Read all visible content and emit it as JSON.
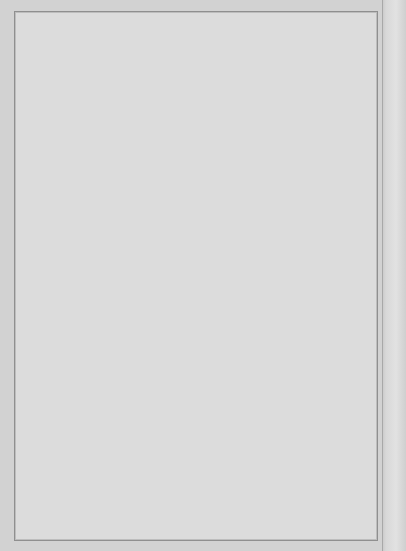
{
  "figure": {
    "panel_letter": "C",
    "background_color": "#dcdcdc",
    "plot_area_color": "#ffffff",
    "ink_color": "#111111"
  },
  "chart_data": [
    {
      "id": "panel-top",
      "type": "line",
      "title": "",
      "xlabel": "LV volume, mL",
      "ylabel": "LV diastolic pressure, mm Hg",
      "xlabel_plain": "LV volume,",
      "xlabel_italic": "mL",
      "ylabel_plain": "LV diastolic pressure,",
      "ylabel_italic": "mm Hg",
      "xlim": [
        0,
        150
      ],
      "ylim": [
        0,
        50
      ],
      "xticks": [
        0,
        50,
        100,
        150
      ],
      "yticks": [
        0,
        10,
        20,
        30,
        40,
        50
      ],
      "grid": false,
      "legend": {
        "title": "RHV, mL",
        "title_plain": "RHV,",
        "title_italic": "mL",
        "position": "top-left-inside",
        "entries": [
          {
            "label": "0",
            "marker": "filled-circle",
            "line": "solid"
          },
          {
            "label": "25",
            "marker": "open-triangle",
            "line": "dashed"
          },
          {
            "label": "50",
            "marker": "open-circle",
            "line": "dotted"
          }
        ]
      },
      "series": [
        {
          "name": "0",
          "marker": "filled-circle",
          "line": "solid",
          "x": [
            0,
            10,
            20,
            30,
            40,
            50,
            60,
            70,
            80,
            90,
            100,
            110,
            120,
            130,
            140,
            150
          ],
          "values": [
            0.3,
            1.4,
            2.6,
            4.1,
            5.5,
            7.0,
            8.6,
            10.2,
            12.0,
            14.4,
            17.0,
            20.3,
            23.7,
            28.4,
            33.8,
            40.0
          ],
          "err_up": [
            0.4,
            0.8,
            0.9,
            1.0,
            1.1,
            1.2,
            1.3,
            1.5,
            1.6,
            1.8,
            2.0,
            2.2,
            2.4,
            2.3,
            2.2,
            2.0
          ]
        },
        {
          "name": "25",
          "marker": "open-triangle",
          "line": "dashed",
          "x": [
            0,
            10,
            20,
            30,
            40,
            50,
            60,
            70,
            80,
            90,
            100,
            110,
            120
          ],
          "values": [
            1.4,
            2.6,
            3.9,
            5.3,
            6.9,
            8.9,
            11.2,
            13.7,
            16.7,
            19.7,
            24.0,
            28.8,
            34.7
          ],
          "err_up": [
            0.5,
            0.9,
            1.0,
            1.2,
            1.3,
            1.6,
            1.8,
            2.1,
            2.4,
            2.7,
            3.1,
            3.3,
            3.4
          ]
        },
        {
          "name": "50",
          "marker": "open-circle",
          "line": "dotted",
          "x": [
            0,
            10,
            20,
            30,
            40,
            50,
            60,
            70,
            80,
            90
          ],
          "values": [
            2.7,
            4.3,
            5.3,
            6.6,
            8.3,
            10.5,
            12.9,
            15.7,
            19.0,
            23.0,
            28.2
          ],
          "err_up": [
            0.6,
            1.0,
            1.2,
            1.4,
            1.6,
            1.9,
            2.2,
            2.6,
            3.0,
            3.4,
            3.8
          ]
        }
      ],
      "series_50_x_extra": [
        100
      ],
      "series_50_values_extra": [
        28.2
      ]
    },
    {
      "id": "panel-bottom",
      "type": "line",
      "title": "",
      "xlabel": "LV volume, mL",
      "ylabel": "Transmural LV diastolic pressure, mm Hg",
      "xlabel_plain": "LV volume,",
      "xlabel_italic": "mL",
      "ylabel_plain": "Transmural LV diastolic pressure,",
      "ylabel_italic": "mm Hg",
      "xlim": [
        0,
        150
      ],
      "ylim": [
        0,
        50
      ],
      "xticks": [
        0,
        50,
        100,
        150
      ],
      "yticks": [
        0,
        10,
        20,
        30,
        40,
        50
      ],
      "grid": false,
      "legend": null,
      "series": [
        {
          "name": "0",
          "marker": "filled-circle",
          "line": "solid",
          "x": [
            0,
            10,
            20,
            30,
            40,
            50,
            60,
            70,
            80,
            90,
            100,
            110,
            120,
            130,
            140,
            150
          ],
          "values": [
            0.4,
            1.3,
            2.4,
            3.6,
            4.8,
            5.9,
            7.1,
            8.3,
            9.7,
            11.3,
            13.2,
            15.3,
            17.7,
            20.5,
            23.7,
            27.0
          ],
          "err_up": [
            0.4,
            0.9,
            1.0,
            1.1,
            1.2,
            1.4,
            1.5,
            1.7,
            1.9,
            2.1,
            2.3,
            2.5,
            2.6,
            2.2,
            1.9,
            1.6
          ]
        },
        {
          "name": "25",
          "marker": "open-triangle",
          "line": "dashed",
          "x": [
            0,
            10,
            20,
            30,
            40,
            50,
            60,
            70,
            80,
            90,
            100,
            110,
            120
          ],
          "values": [
            0.8,
            1.9,
            3.1,
            4.3,
            5.6,
            6.9,
            8.2,
            9.6,
            11.2,
            13.0,
            14.8,
            16.7,
            19.0
          ],
          "err_up": [
            0.5,
            1.0,
            1.1,
            1.3,
            1.5,
            1.7,
            1.9,
            2.1,
            2.4,
            2.6,
            2.8,
            2.9,
            3.0
          ]
        },
        {
          "name": "50",
          "marker": "open-circle",
          "line": "dotted",
          "x": [
            0,
            10,
            20,
            30,
            40,
            50,
            60,
            70,
            80,
            90,
            100
          ],
          "values": [
            1.0,
            2.2,
            3.4,
            4.6,
            5.9,
            7.2,
            8.6,
            10.0,
            11.6,
            13.4,
            15.2
          ],
          "err_up": [
            0.5,
            1.0,
            1.2,
            1.4,
            1.6,
            1.8,
            2.0,
            2.2,
            2.5,
            2.7,
            2.9
          ]
        }
      ]
    }
  ]
}
